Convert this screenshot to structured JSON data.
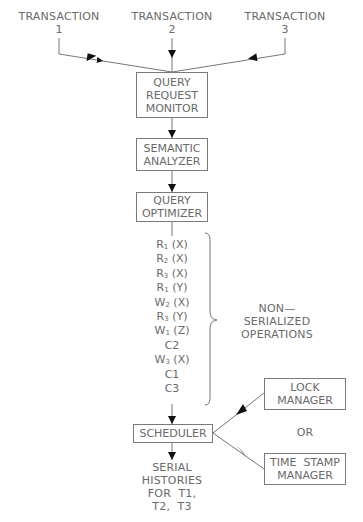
{
  "transactions": [
    {
      "label": "TRANSACTION",
      "number": "1"
    },
    {
      "label": "TRANSACTION",
      "number": "2"
    },
    {
      "label": "TRANSACTION",
      "number": "3"
    }
  ],
  "pipeline": {
    "query_request_monitor": [
      "QUERY",
      "REQUEST",
      "MONITOR"
    ],
    "semantic_analyzer": [
      "SEMANTIC",
      "ANALYZER"
    ],
    "query_optimizer": [
      "QUERY",
      "OPTIMIZER"
    ],
    "scheduler": "SCHEDULER"
  },
  "operations": [
    {
      "op": "R",
      "sub": "1",
      "arg": "(X)"
    },
    {
      "op": "R",
      "sub": "2",
      "arg": "(X)"
    },
    {
      "op": "R",
      "sub": "3",
      "arg": "(X)"
    },
    {
      "op": "R",
      "sub": "1",
      "arg": "(Y)"
    },
    {
      "op": "W",
      "sub": "2",
      "arg": "(X)"
    },
    {
      "op": "R",
      "sub": "3",
      "arg": "(Y)"
    },
    {
      "op": "W",
      "sub": "1",
      "arg": "(Z)"
    },
    {
      "op": "C2",
      "sub": "",
      "arg": ""
    },
    {
      "op": "W",
      "sub": "3",
      "arg": "(X)"
    },
    {
      "op": "C1",
      "sub": "",
      "arg": ""
    },
    {
      "op": "C3",
      "sub": "",
      "arg": ""
    }
  ],
  "operations_label": [
    "NON—",
    "SERIALIZED",
    "OPERATIONS"
  ],
  "managers": {
    "lock_manager": [
      "LOCK",
      "MANAGER"
    ],
    "or_label": "OR",
    "time_stamp_manager": [
      "TIME  STAMP",
      "MANAGER"
    ]
  },
  "output": [
    "SERIAL",
    "HISTORIES",
    "FOR  T1,",
    "T2,  T3"
  ],
  "colors": {
    "line": "#555555",
    "text": "#6a6a6a",
    "arrow": "#111111"
  }
}
